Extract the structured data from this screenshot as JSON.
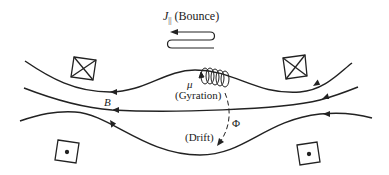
{
  "diagram": {
    "labels": {
      "bounce_symbol": "J",
      "bounce_sub": "||",
      "bounce_text": "(Bounce)",
      "mu": "μ",
      "gyration": "(Gyration)",
      "field": "B",
      "phi": "Φ",
      "drift": "(Drift)"
    },
    "coils": [
      {
        "type": "current-into-page",
        "symbol": "cross"
      },
      {
        "type": "current-into-page",
        "symbol": "cross"
      },
      {
        "type": "current-out-of-page",
        "symbol": "dot"
      },
      {
        "type": "current-out-of-page",
        "symbol": "dot"
      }
    ],
    "colors": {
      "stroke": "#222222",
      "background": "#ffffff"
    }
  }
}
